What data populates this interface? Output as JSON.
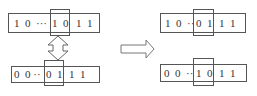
{
  "diagram": {
    "title": "",
    "left": {
      "top_string": {
        "bits": [
          "1",
          "0",
          "···",
          "1",
          "0",
          "1",
          "1"
        ],
        "highlighted": [
          "1",
          "0"
        ]
      },
      "bottom_string": {
        "bits": [
          "0",
          "0",
          "··",
          "0",
          "1",
          "1",
          "1"
        ],
        "highlighted": [
          "0",
          "1"
        ]
      },
      "swap_icon": "double-vertical-arrow"
    },
    "transition_icon": "right-hollow-arrow",
    "right": {
      "top_string": {
        "bits": [
          "1",
          "0",
          "··",
          "0",
          "1",
          "1",
          "1"
        ],
        "highlighted": [
          "0",
          "1"
        ]
      },
      "bottom_string": {
        "bits": [
          "0",
          "0",
          "··",
          "1",
          "0",
          "1",
          "1"
        ],
        "highlighted": [
          "1",
          "0"
        ]
      }
    }
  },
  "labels": {
    "lt_pre": "1  0  ···",
    "lt_hl": "1  0",
    "lt_post": "1  1",
    "lb_pre": "0  0 ··",
    "lb_hl": "0  1",
    "lb_post": "1  1",
    "rt_pre": "1  0  ··",
    "rt_hl": "0  1",
    "rt_post": "1  1",
    "rb_pre": "0  0  ··",
    "rb_hl": "1  0",
    "rb_post": "1  1"
  }
}
